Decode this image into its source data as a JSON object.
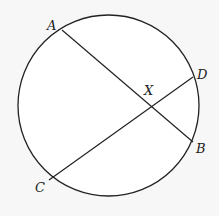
{
  "diagram": {
    "background": "#f7f7f7",
    "stroke_color": "#222222",
    "circle": {
      "cx": 108.5,
      "cy": 105.5,
      "r": 90.5
    },
    "points": {
      "A": {
        "label": "A",
        "x": 62,
        "y": 30,
        "lx": 47,
        "ly": 30
      },
      "B": {
        "label": "B",
        "x": 193,
        "y": 142,
        "lx": 196,
        "ly": 153
      },
      "C": {
        "label": "C",
        "x": 49,
        "y": 180,
        "lx": 35,
        "ly": 192
      },
      "D": {
        "label": "D",
        "x": 193,
        "y": 77,
        "lx": 197,
        "ly": 79
      },
      "X": {
        "label": "X",
        "x": 150,
        "y": 108,
        "lx": 144,
        "ly": 95
      }
    },
    "chords": [
      {
        "name": "AB",
        "from": "A",
        "to": "B"
      },
      {
        "name": "CD",
        "from": "C",
        "to": "D"
      }
    ]
  }
}
